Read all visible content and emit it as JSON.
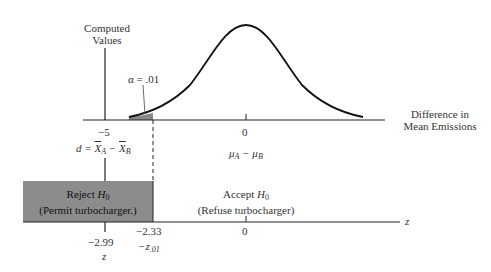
{
  "diagram": {
    "type": "hypothesis-test-sampling-distribution",
    "top_axis": {
      "vertical_label_line1": "Computed",
      "vertical_label_line2": "Values",
      "alpha_label": "α = .01",
      "tick_left": "−5",
      "tick_center": "0",
      "axis_label_line1": "Difference in",
      "axis_label_line2": "Mean Emissions",
      "statistic_label": "d = X̄A − X̄B",
      "statistic_parts": {
        "d": "d",
        "eq": " = ",
        "xa": "X",
        "a": "A",
        "minus": " − ",
        "xb": "X",
        "b": "B"
      },
      "mean_label_parts": {
        "mu1": "μ",
        "a": "A",
        "minus": " − ",
        "mu2": "μ",
        "b": "B"
      }
    },
    "bottom_axis": {
      "reject_line1_text": "Reject ",
      "reject_h": "H",
      "reject_sub": "0",
      "reject_line2": "(Permit turbocharger.)",
      "accept_line1_text": "Accept ",
      "accept_h": "H",
      "accept_sub": "0",
      "accept_line2": "(Refuse turbocharger)",
      "tick_critical": "−2.33",
      "critical_label": "−z",
      "critical_sub": ".01",
      "tick_computed": "−2.99",
      "computed_label": "z",
      "tick_center": "0",
      "axis_label": "z"
    },
    "colors": {
      "reject_region": "#8a8a8a",
      "curve": "#111111",
      "axis": "#222222",
      "tail_shade": "#888888"
    }
  }
}
